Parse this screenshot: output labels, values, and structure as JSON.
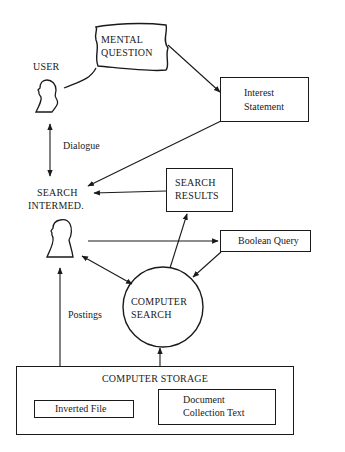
{
  "diagram": {
    "nodes": {
      "user": {
        "label": "USER"
      },
      "mental_question": {
        "line1": "MENTAL",
        "line2": "QUESTION"
      },
      "interest_statement": {
        "line1": "Interest",
        "line2": "Statement"
      },
      "search_intermediary": {
        "line1": "SEARCH",
        "line2": "INTERMED."
      },
      "search_results": {
        "line1": "SEARCH",
        "line2": "RESULTS"
      },
      "boolean_query": {
        "label": "Boolean Query"
      },
      "computer_search": {
        "line1": "COMPUTER",
        "line2": "SEARCH"
      },
      "computer_storage": {
        "label": "COMPUTER STORAGE"
      },
      "inverted_file": {
        "label": "Inverted File"
      },
      "document_collection": {
        "line1": "Document",
        "line2": "Collection Text"
      }
    },
    "edge_labels": {
      "dialogue": "Dialogue",
      "postings": "Postings"
    },
    "edges": [
      {
        "from": "user",
        "to": "search_intermediary",
        "label": "Dialogue",
        "bidirectional": true
      },
      {
        "from": "user",
        "to": "mental_question",
        "type": "thought-bubble"
      },
      {
        "from": "mental_question",
        "to": "interest_statement"
      },
      {
        "from": "interest_statement",
        "to": "search_intermediary"
      },
      {
        "from": "search_results",
        "to": "search_intermediary"
      },
      {
        "from": "search_intermediary",
        "to": "boolean_query"
      },
      {
        "from": "boolean_query",
        "to": "computer_search"
      },
      {
        "from": "computer_search",
        "to": "search_results"
      },
      {
        "from": "search_intermediary",
        "to": "computer_search",
        "bidirectional": true
      },
      {
        "from": "search_intermediary",
        "to": "computer_storage",
        "label": "Postings",
        "bidirectional": true
      },
      {
        "from": "computer_storage",
        "to": "computer_search"
      },
      {
        "from": "inverted_file",
        "to": "document_collection"
      }
    ]
  }
}
